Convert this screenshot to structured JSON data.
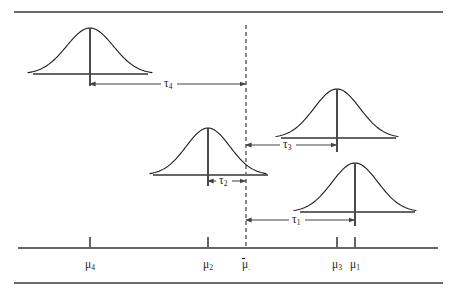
{
  "figure": {
    "type": "statistical-diagram",
    "background_color": "#ffffff",
    "ink_color": "#1c1c1c",
    "line_color": "#555555"
  },
  "frame": {
    "top_rule": {
      "y": 12,
      "x1": 14,
      "x2": 443
    },
    "bottom_rule": {
      "y": 283,
      "x1": 14,
      "x2": 443
    }
  },
  "chart_data": {
    "type": "line",
    "title": "",
    "subtitle": "",
    "xlabel": "",
    "ylabel": "",
    "grid": false,
    "legend_position": "none",
    "axis": {
      "name": "number-line",
      "y": 248,
      "x_start": 18,
      "x_end": 438,
      "tick_height": 11
    },
    "reference_line": {
      "name": "grand-mean-line",
      "label": "grand mean",
      "style": "dashed",
      "x": 246,
      "y_top": 25,
      "y_bottom": 248
    },
    "ticks": [
      {
        "id": "mu4",
        "label": "μ",
        "subscript": "4",
        "x": 90,
        "overbar": false
      },
      {
        "id": "mu2",
        "label": "μ",
        "subscript": "2",
        "x": 208,
        "overbar": false
      },
      {
        "id": "mubar",
        "label": "μ",
        "subscript": ".",
        "x": 246,
        "overbar": true
      },
      {
        "id": "mu3",
        "label": "μ",
        "subscript": "3",
        "x": 337,
        "overbar": false
      },
      {
        "id": "mu1",
        "label": "μ",
        "subscript": "1",
        "x": 355,
        "overbar": false
      }
    ],
    "curves": [
      {
        "id": "dist-mu4",
        "name": "normal-curve-mu4",
        "center_x": 90,
        "baseline_y": 74,
        "peak_y": 28,
        "half_width": 62,
        "stem_bottom_y": 86,
        "baseline_x1": 33,
        "baseline_x2": 148
      },
      {
        "id": "dist-mu2",
        "name": "normal-curve-mu2",
        "center_x": 208,
        "baseline_y": 175,
        "peak_y": 128,
        "half_width": 58,
        "stem_bottom_y": 186,
        "baseline_x1": 153,
        "baseline_x2": 268
      },
      {
        "id": "dist-mu3",
        "name": "normal-curve-mu3",
        "center_x": 337,
        "baseline_y": 138,
        "peak_y": 89,
        "half_width": 61,
        "stem_bottom_y": 152,
        "baseline_x1": 281,
        "baseline_x2": 396
      },
      {
        "id": "dist-mu1",
        "name": "normal-curve-mu1",
        "center_x": 355,
        "baseline_y": 212,
        "peak_y": 163,
        "half_width": 61,
        "stem_bottom_y": 226,
        "baseline_x1": 300,
        "baseline_x2": 415
      }
    ],
    "effect_arrows": [
      {
        "id": "tau4",
        "label": "τ",
        "subscript": "4",
        "y": 84,
        "x_from": 90,
        "x_to": 246,
        "heads": "both",
        "direction": "mean-to-grand-mean",
        "label_x": 164,
        "label_y": 78
      },
      {
        "id": "tau3",
        "label": "τ",
        "subscript": "3",
        "y": 145,
        "x_from": 246,
        "x_to": 337,
        "heads": "both",
        "direction": "grand-mean-to-mean",
        "label_x": 283,
        "label_y": 139
      },
      {
        "id": "tau2",
        "label": "τ",
        "subscript": "2",
        "y": 181,
        "x_from": 208,
        "x_to": 246,
        "heads": "both",
        "direction": "mean-to-grand-mean",
        "label_x": 219,
        "label_y": 175
      },
      {
        "id": "tau1",
        "label": "τ",
        "subscript": "1",
        "y": 220,
        "x_from": 246,
        "x_to": 355,
        "heads": "both",
        "direction": "grand-mean-to-mean",
        "label_x": 292,
        "label_y": 214
      }
    ]
  }
}
